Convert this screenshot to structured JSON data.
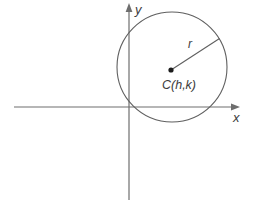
{
  "figure": {
    "type": "coordinate-plane-with-circle",
    "labels": {
      "y_axis": "y",
      "x_axis": "x",
      "radius": "r",
      "center": "C(h,k)"
    },
    "colors": {
      "background": "#ffffff",
      "axis": "#6e6e6e",
      "circle": "#5f5f5f",
      "radius_line": "#5f5f5f",
      "center_dot": "#1c1c1c",
      "text": "#3c3c3c"
    }
  }
}
